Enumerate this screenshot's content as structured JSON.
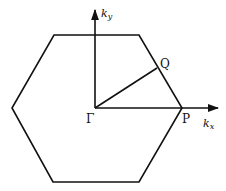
{
  "diagram": {
    "labels": {
      "gamma": "Γ",
      "p": "P",
      "q": "Q",
      "kx_base": "k",
      "kx_sub": "x",
      "ky_base": "k",
      "ky_sub": "y"
    },
    "colors": {
      "stroke": "#111111",
      "background": "#ffffff"
    }
  }
}
